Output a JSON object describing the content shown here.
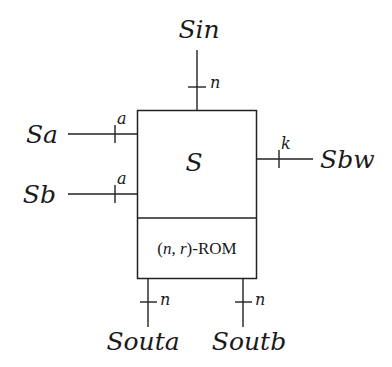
{
  "diagram": {
    "block": {
      "top_label": "S",
      "bottom_label_parts": [
        {
          "text": "(",
          "italic": false
        },
        {
          "text": "n",
          "italic": true
        },
        {
          "text": ", ",
          "italic": false
        },
        {
          "text": "r",
          "italic": true
        },
        {
          "text": ")-ROM",
          "italic": false
        }
      ]
    },
    "ports": {
      "sin": {
        "name": "Sin",
        "width": "n",
        "direction": "top"
      },
      "sa": {
        "name": "Sa",
        "width": "a",
        "direction": "left"
      },
      "sb": {
        "name": "Sb",
        "width": "a",
        "direction": "left"
      },
      "sbw": {
        "name": "Sbw",
        "width": "k",
        "direction": "right"
      },
      "souta": {
        "name": "Souta",
        "width": "n",
        "direction": "bottom"
      },
      "soutb": {
        "name": "Soutb",
        "width": "n",
        "direction": "bottom"
      }
    }
  }
}
